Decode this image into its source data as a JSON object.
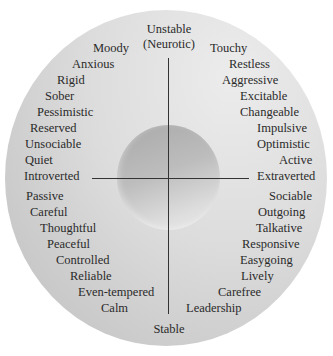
{
  "diagram": {
    "title_top": [
      "Unstable",
      "(Neurotic)"
    ],
    "bottom": "Stable",
    "left": "Introverted",
    "right": "Extraverted",
    "upper_left": [
      "Moody",
      "Anxious",
      "Rigid",
      "Sober",
      "Pessimistic",
      "Reserved",
      "Unsociable",
      "Quiet"
    ],
    "upper_right": [
      "Touchy",
      "Restless",
      "Aggressive",
      "Excitable",
      "Changeable",
      "Impulsive",
      "Optimistic",
      "Active"
    ],
    "lower_left": [
      "Passive",
      "Careful",
      "Thoughtful",
      "Peaceful",
      "Controlled",
      "Reliable",
      "Even-tempered",
      "Calm"
    ],
    "lower_right": [
      "Sociable",
      "Outgoing",
      "Talkative",
      "Responsive",
      "Easygoing",
      "Lively",
      "Carefree",
      "Leadership"
    ],
    "colors": {
      "outer_light": "#ececec",
      "outer_dark": "#c2c2c2",
      "inner_dark": "#a9a9a9",
      "inner_light": "#eaeaea",
      "axis": "#333333",
      "text": "#2a2a2a"
    }
  }
}
